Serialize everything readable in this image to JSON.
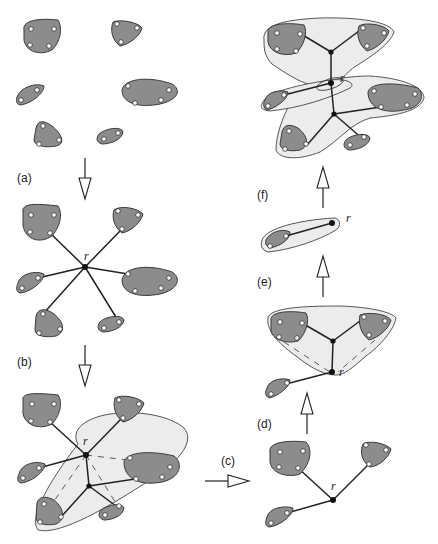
{
  "figure": {
    "panels": [
      {
        "id": "a",
        "label": "(a)",
        "description": "Six point clusters"
      },
      {
        "id": "b",
        "label": "(b)",
        "description": "Star tree from root r to all clusters"
      },
      {
        "id": "c",
        "label": "(c)",
        "description": "Subset of clusters grouped in hull with Steiner node"
      },
      {
        "id": "d",
        "label": "(d)",
        "description": "Reduced tree with three clusters and root r"
      },
      {
        "id": "e",
        "label": "(e)",
        "description": "Two clusters merged under hull, connected to root r"
      },
      {
        "id": "f",
        "label": "(f)",
        "description": "Single cluster connected to root r"
      }
    ],
    "root_label": "r",
    "labels": {
      "a": "(a)",
      "b": "(b)",
      "c": "(c)",
      "d": "(d)",
      "e": "(e)",
      "f": "(f)"
    },
    "colors": {
      "cluster_fill": "#8c8c8c",
      "hull_fill": "#ececec",
      "edge": "#222222",
      "background": "#ffffff"
    }
  }
}
